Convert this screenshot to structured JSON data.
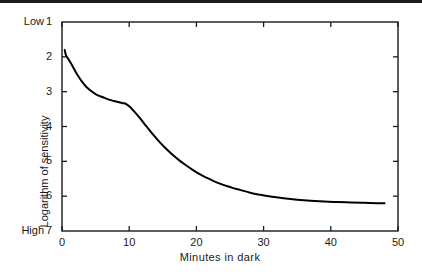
{
  "chart_data": {
    "type": "line",
    "title": "",
    "xlabel": "Minutes in dark",
    "ylabel": "Logarithm of sensitivity",
    "xlim": [
      0,
      50
    ],
    "ylim": [
      1,
      7
    ],
    "y_inverted": true,
    "grid": false,
    "legend": null,
    "frame": "box",
    "tick_direction": "in",
    "axis_endpoint_labels": {
      "y_top": "Low",
      "y_bottom": "High"
    },
    "xticks": [
      0,
      10,
      20,
      30,
      40,
      50
    ],
    "xtick_labels": [
      "0",
      "10",
      "20",
      "30",
      "40",
      "50"
    ],
    "yticks": [
      1,
      2,
      3,
      4,
      5,
      6,
      7
    ],
    "ytick_labels": [
      "1",
      "2",
      "3",
      "4",
      "5",
      "6",
      "7"
    ],
    "series": [
      {
        "name": "dark adaptation curve",
        "color": "#000000",
        "line_width": 2.0,
        "annotations": [
          "rod-cone break at approximately 9 minutes"
        ],
        "x": [
          0.4,
          0.6,
          0.9,
          1.2,
          1.6,
          2.0,
          2.5,
          3.0,
          3.6,
          4.2,
          5.0,
          5.8,
          6.6,
          7.4,
          8.2,
          9.0,
          9.4,
          10.0,
          10.8,
          11.6,
          12.5,
          13.5,
          14.5,
          15.5,
          16.5,
          17.5,
          18.5,
          19.5,
          20.5,
          21.5,
          22.5,
          23.5,
          24.5,
          25.5,
          26.5,
          28.0,
          29.5,
          31.0,
          33.0,
          35.0,
          37.0,
          39.0,
          41.0,
          43.0,
          45.0,
          47.0,
          48.0
        ],
        "y": [
          1.8,
          1.96,
          2.05,
          2.14,
          2.28,
          2.42,
          2.58,
          2.72,
          2.86,
          2.96,
          3.07,
          3.14,
          3.2,
          3.25,
          3.29,
          3.33,
          3.34,
          3.42,
          3.58,
          3.76,
          3.98,
          4.22,
          4.44,
          4.64,
          4.82,
          4.98,
          5.12,
          5.25,
          5.37,
          5.47,
          5.56,
          5.64,
          5.71,
          5.77,
          5.82,
          5.9,
          5.96,
          6.01,
          6.06,
          6.1,
          6.13,
          6.15,
          6.17,
          6.18,
          6.19,
          6.2,
          6.2
        ]
      }
    ]
  },
  "axes": {
    "low_label": "Low",
    "high_label": "High"
  }
}
